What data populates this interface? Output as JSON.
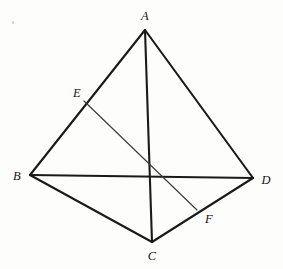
{
  "figure": {
    "background_color": "#fdfdfc",
    "stroke_color": "#1a1a1a",
    "thin_stroke_color": "#3a3a3a"
  },
  "labels": {
    "A": "A",
    "B": "B",
    "C": "C",
    "D": "D",
    "E": "E",
    "F": "F"
  },
  "chart_data": {
    "type": "diagram",
    "points": [
      {
        "name": "A",
        "x": 145,
        "y": 30,
        "label": "A",
        "label_x": 145,
        "label_y": 16
      },
      {
        "name": "B",
        "x": 30,
        "y": 175,
        "label": "B",
        "label_x": 17,
        "label_y": 176
      },
      {
        "name": "C",
        "x": 152,
        "y": 242,
        "label": "C",
        "label_x": 152,
        "label_y": 256
      },
      {
        "name": "D",
        "x": 253,
        "y": 178,
        "label": "D",
        "label_x": 266,
        "label_y": 180
      },
      {
        "name": "E",
        "x": 84,
        "y": 101,
        "label": "E",
        "label_x": 77,
        "label_y": 93
      },
      {
        "name": "F",
        "x": 197,
        "y": 210,
        "label": "F",
        "label_x": 209,
        "label_y": 219
      }
    ],
    "edges": [
      {
        "from": "A",
        "to": "B",
        "style": "solid"
      },
      {
        "from": "A",
        "to": "D",
        "style": "solid"
      },
      {
        "from": "A",
        "to": "C",
        "style": "solid"
      },
      {
        "from": "B",
        "to": "D",
        "style": "solid"
      },
      {
        "from": "B",
        "to": "C",
        "style": "solid"
      },
      {
        "from": "C",
        "to": "D",
        "style": "solid"
      },
      {
        "from": "E",
        "to": "F",
        "style": "thin"
      }
    ]
  }
}
